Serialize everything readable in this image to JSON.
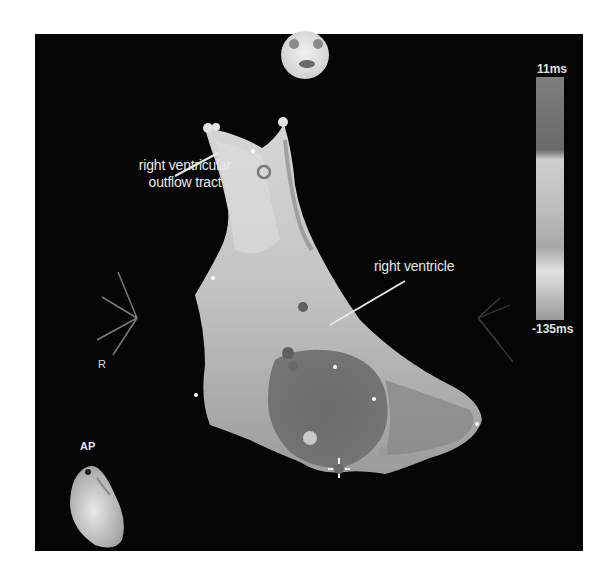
{
  "image": {
    "description": "Electroanatomic activation map of the right ventricle, AP view",
    "view_label": "AP",
    "orientation_label": "R"
  },
  "annotations": {
    "rvot_line1": "right ventricular",
    "rvot_line2": "outflow tract",
    "rv": "right ventricle"
  },
  "color_scale": {
    "max_label": "11ms",
    "min_label": "-135ms",
    "max_value_ms": 11,
    "min_value_ms": -135
  },
  "colors": {
    "panel_background": "#050505",
    "page_background": "#ffffff",
    "label_text": "#e8e8e8"
  }
}
